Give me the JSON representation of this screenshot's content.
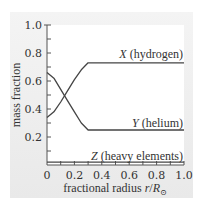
{
  "chart_data": {
    "type": "line",
    "title": "",
    "xlabel": "fractional radius r/R⊙",
    "xlabel_parts": {
      "prefix": "fractional radius ",
      "var": "r",
      "slash": "/",
      "R": "R",
      "sub": "⊙"
    },
    "ylabel": "mass fraction",
    "xlim": [
      0,
      1.0
    ],
    "ylim": [
      0,
      1.0
    ],
    "x_ticks": [
      "0",
      "0.2",
      "0.4",
      "0.6",
      "0.8",
      "1.0"
    ],
    "y_ticks": [
      "0.2",
      "0.4",
      "0.6",
      "0.8",
      "1.0"
    ],
    "minor_tick_step": 0.1,
    "grid": false,
    "legend": "inline labels",
    "series": [
      {
        "name": "X (hydrogen)",
        "symbol": "X",
        "desc": "(hydrogen)",
        "x": [
          0,
          0.05,
          0.1,
          0.15,
          0.2,
          0.25,
          0.3,
          1.0
        ],
        "y": [
          0.34,
          0.38,
          0.45,
          0.53,
          0.61,
          0.68,
          0.73,
          0.73
        ]
      },
      {
        "name": "Y (helium)",
        "symbol": "Y",
        "desc": "(helium)",
        "x": [
          0,
          0.05,
          0.1,
          0.15,
          0.2,
          0.25,
          0.3,
          1.0
        ],
        "y": [
          0.66,
          0.62,
          0.54,
          0.46,
          0.38,
          0.3,
          0.25,
          0.25
        ]
      },
      {
        "name": "Z (heavy elements)",
        "symbol": "Z",
        "desc": "(heavy elements)",
        "x": [
          0,
          1.0
        ],
        "y": [
          0.02,
          0.02
        ]
      }
    ]
  },
  "colors": {
    "line": "#444444",
    "axis": "#555555",
    "panel": "#ececec",
    "plot_bg": "#ffffff"
  }
}
